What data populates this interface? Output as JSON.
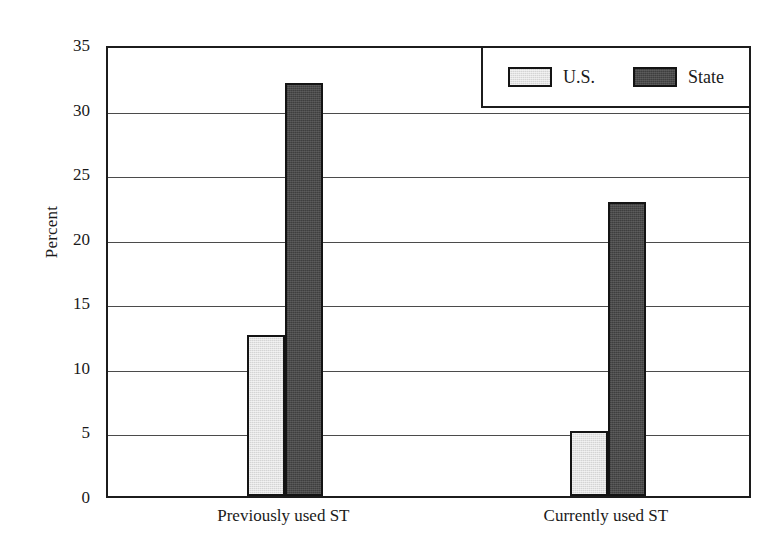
{
  "chart_data": {
    "type": "bar",
    "title": "",
    "xlabel": "",
    "ylabel": "Percent",
    "ylim": [
      0,
      35
    ],
    "yticks": [
      0,
      5,
      10,
      15,
      20,
      25,
      30,
      35
    ],
    "ytick_labels": [
      "0",
      "5",
      "10",
      "15",
      "20",
      "25",
      "30",
      "35"
    ],
    "grid": true,
    "legend_position": "top-right",
    "categories": [
      "Previously used ST",
      "Currently used ST"
    ],
    "series": [
      {
        "name": "U.S.",
        "values": [
          12.5,
          5.0
        ],
        "color": "#d4d4d4"
      },
      {
        "name": "State",
        "values": [
          32.0,
          22.8
        ],
        "color": "#4a4a4a"
      }
    ]
  },
  "legend": {
    "entries": [
      {
        "label": "U.S."
      },
      {
        "label": "State"
      }
    ]
  },
  "axes": {
    "y_title": "Percent"
  }
}
